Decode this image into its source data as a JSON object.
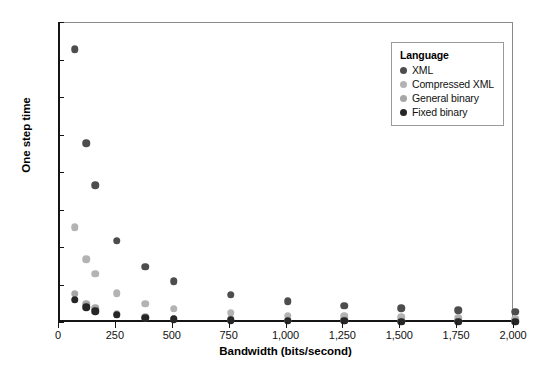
{
  "chart_data": {
    "type": "scatter",
    "title": "",
    "xlabel": "Bandwidth (bits/second)",
    "ylabel": "One step time",
    "xlim": [
      0,
      2000
    ],
    "ylim": [
      0,
      40
    ],
    "grid": false,
    "legend_position": "top-right",
    "legend_title": "Language",
    "x": [
      65,
      115,
      155,
      250,
      375,
      500,
      750,
      1000,
      1250,
      1500,
      1750,
      2000
    ],
    "xticks": [
      0,
      250,
      500,
      750,
      1000,
      1250,
      1500,
      1750,
      2000
    ],
    "xtick_labels": [
      "0",
      "250",
      "500",
      "750",
      "1,000",
      "1,250",
      "1,500",
      "1,750",
      "2,000"
    ],
    "yticks": [
      0,
      5,
      10,
      15,
      20,
      25,
      30,
      35,
      40
    ],
    "ytick_labels": [
      "0",
      "5",
      "10",
      "15",
      "20",
      "25",
      "30",
      "35",
      "40"
    ],
    "series": [
      {
        "name": "XML",
        "color": "#4d4d4d",
        "values": [
          36.5,
          24.0,
          18.4,
          11.0,
          7.5,
          5.6,
          3.8,
          2.9,
          2.3,
          2.0,
          1.7,
          1.5
        ]
      },
      {
        "name": "Compressed XML",
        "color": "#b3b3b3",
        "values": [
          12.8,
          8.5,
          6.6,
          4.0,
          2.6,
          1.9,
          1.4,
          1.0,
          0.9,
          0.8,
          0.7,
          0.6
        ]
      },
      {
        "name": "General binary",
        "color": "#a6a6a6",
        "values": [
          3.9,
          2.5,
          2.0,
          1.2,
          0.8,
          0.6,
          0.5,
          0.4,
          0.4,
          0.3,
          0.3,
          0.3
        ]
      },
      {
        "name": "Fixed binary",
        "color": "#262626",
        "values": [
          3.1,
          2.1,
          1.6,
          1.1,
          0.7,
          0.5,
          0.4,
          0.3,
          0.3,
          0.2,
          0.2,
          0.2
        ]
      }
    ]
  }
}
